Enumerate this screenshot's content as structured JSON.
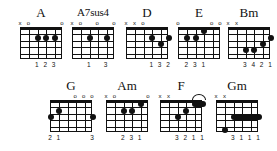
{
  "sheet": {
    "title": "Guitar Chord Diagrams",
    "background_color": "#ffffff",
    "ink_color": "#111111",
    "strings": 6,
    "frets": 5,
    "marker_open": "o",
    "marker_muted": "x"
  },
  "chords": [
    {
      "name": "A",
      "row": 1,
      "left": 20,
      "top": 6,
      "grid_width": 42,
      "grid_height": 32,
      "name_size": "normal",
      "markers": [
        "x",
        "o",
        "",
        "",
        "",
        "o"
      ],
      "dots": [
        {
          "string": 4,
          "fret": 2
        },
        {
          "string": 3,
          "fret": 2
        },
        {
          "string": 2,
          "fret": 2
        }
      ],
      "barres": [],
      "arcs": [],
      "fingers": [
        {
          "string": 4,
          "label": "1"
        },
        {
          "string": 3,
          "label": "2"
        },
        {
          "string": 2,
          "label": "3"
        }
      ]
    },
    {
      "name": "A7sus4",
      "row": 1,
      "left": 72,
      "top": 6,
      "grid_width": 42,
      "grid_height": 32,
      "name_size": "small",
      "markers": [
        "x",
        "o",
        "",
        "o",
        "",
        "o"
      ],
      "dots": [
        {
          "string": 4,
          "fret": 2
        },
        {
          "string": 2,
          "fret": 2
        }
      ],
      "barres": [],
      "arcs": [],
      "fingers": [
        {
          "string": 4,
          "label": "1"
        },
        {
          "string": 2,
          "label": "3"
        }
      ]
    },
    {
      "name": "D",
      "row": 1,
      "left": 126,
      "top": 6,
      "grid_width": 42,
      "grid_height": 32,
      "name_size": "normal",
      "markers": [
        "x",
        "x",
        "o",
        "",
        "",
        ""
      ],
      "dots": [
        {
          "string": 3,
          "fret": 2
        },
        {
          "string": 1,
          "fret": 2
        },
        {
          "string": 2,
          "fret": 3
        }
      ],
      "barres": [],
      "arcs": [],
      "fingers": [
        {
          "string": 3,
          "label": "1"
        },
        {
          "string": 2,
          "label": "3"
        },
        {
          "string": 1,
          "label": "2"
        }
      ]
    },
    {
      "name": "E",
      "row": 1,
      "left": 178,
      "top": 6,
      "grid_width": 42,
      "grid_height": 32,
      "name_size": "normal",
      "markers": [
        "o",
        "",
        "",
        "",
        "o",
        "o"
      ],
      "dots": [
        {
          "string": 5,
          "fret": 2
        },
        {
          "string": 4,
          "fret": 2
        },
        {
          "string": 3,
          "fret": 1
        }
      ],
      "barres": [],
      "arcs": [],
      "fingers": [
        {
          "string": 5,
          "label": "2"
        },
        {
          "string": 4,
          "label": "3"
        },
        {
          "string": 3,
          "label": "1"
        }
      ]
    },
    {
      "name": "Bm",
      "row": 1,
      "left": 228,
      "top": 6,
      "grid_width": 42,
      "grid_height": 32,
      "name_size": "normal",
      "markers": [
        "x",
        "x",
        "",
        "",
        "",
        ""
      ],
      "dots": [
        {
          "string": 1,
          "fret": 2
        },
        {
          "string": 2,
          "fret": 3
        },
        {
          "string": 4,
          "fret": 4
        },
        {
          "string": 3,
          "fret": 4
        }
      ],
      "barres": [],
      "arcs": [],
      "fingers": [
        {
          "string": 4,
          "label": "3"
        },
        {
          "string": 3,
          "label": "4"
        },
        {
          "string": 2,
          "label": "2"
        },
        {
          "string": 1,
          "label": "1"
        }
      ]
    },
    {
      "name": "G",
      "row": 2,
      "left": 50,
      "top": 79,
      "grid_width": 42,
      "grid_height": 32,
      "name_size": "normal",
      "markers": [
        "",
        "",
        "",
        "o",
        "o",
        "o"
      ],
      "dots": [
        {
          "string": 5,
          "fret": 2
        },
        {
          "string": 6,
          "fret": 3
        },
        {
          "string": 1,
          "fret": 3
        }
      ],
      "barres": [],
      "arcs": [],
      "fingers": [
        {
          "string": 6,
          "label": "2"
        },
        {
          "string": 5,
          "label": "1"
        },
        {
          "string": 1,
          "label": "3"
        }
      ]
    },
    {
      "name": "Am",
      "row": 2,
      "left": 106,
      "top": 79,
      "grid_width": 42,
      "grid_height": 32,
      "name_size": "normal",
      "markers": [
        "x",
        "o",
        "",
        "",
        "",
        "o"
      ],
      "dots": [
        {
          "string": 4,
          "fret": 2
        },
        {
          "string": 3,
          "fret": 2
        },
        {
          "string": 2,
          "fret": 1
        }
      ],
      "barres": [],
      "arcs": [],
      "fingers": [
        {
          "string": 4,
          "label": "2"
        },
        {
          "string": 3,
          "label": "3"
        },
        {
          "string": 2,
          "label": "1"
        }
      ]
    },
    {
      "name": "F",
      "row": 2,
      "left": 160,
      "top": 79,
      "grid_width": 42,
      "grid_height": 32,
      "name_size": "normal",
      "markers": [
        "x",
        "x",
        "",
        "",
        "",
        ""
      ],
      "dots": [
        {
          "string": 4,
          "fret": 3
        },
        {
          "string": 3,
          "fret": 2
        }
      ],
      "barres": [
        {
          "from_string": 2,
          "to_string": 1,
          "fret": 1
        }
      ],
      "arcs": [
        {
          "from_string": 2,
          "to_string": 1
        }
      ],
      "fingers": [
        {
          "string": 4,
          "label": "3"
        },
        {
          "string": 3,
          "label": "2"
        },
        {
          "string": 2,
          "label": "1"
        },
        {
          "string": 1,
          "label": "1"
        }
      ]
    },
    {
      "name": "Gm",
      "row": 2,
      "left": 216,
      "top": 79,
      "grid_width": 42,
      "grid_height": 32,
      "name_size": "normal",
      "markers": [
        "x",
        "x",
        "",
        "",
        "",
        ""
      ],
      "dots": [
        {
          "string": 5,
          "fret": 5
        }
      ],
      "barres": [
        {
          "from_string": 4,
          "to_string": 1,
          "fret": 3
        }
      ],
      "arcs": [],
      "fingers": [
        {
          "string": 4,
          "label": "3"
        },
        {
          "string": 3,
          "label": "1"
        },
        {
          "string": 2,
          "label": "1"
        },
        {
          "string": 1,
          "label": "1"
        }
      ]
    }
  ]
}
